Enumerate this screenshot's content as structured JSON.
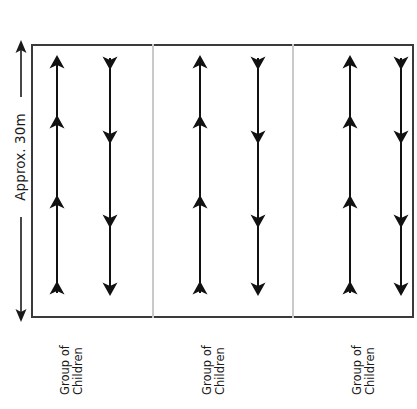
{
  "diagram": {
    "dimension": {
      "label": "Approx. 30m",
      "icon": "double-headed-vertical-arrow",
      "orientation": "vertical",
      "color": "#1a1a1a"
    },
    "frame": {
      "border_color": "#3a3a3a",
      "fill_color": "#ffffff",
      "divider_color": "#c9c9c9"
    },
    "arrow_color": "#111111",
    "groups": [
      {
        "label_line1": "Group of",
        "label_line2": "Children",
        "columns": [
          {
            "direction": "up",
            "icon": "arrow-up-line",
            "marker_count": 4
          },
          {
            "direction": "down",
            "icon": "arrow-down-line",
            "marker_count": 4
          }
        ]
      },
      {
        "label_line1": "Group of",
        "label_line2": "Children",
        "columns": [
          {
            "direction": "up",
            "icon": "arrow-up-line",
            "marker_count": 4
          },
          {
            "direction": "down",
            "icon": "arrow-down-line",
            "marker_count": 4
          }
        ]
      },
      {
        "label_line1": "Group of",
        "label_line2": "Children",
        "columns": [
          {
            "direction": "up",
            "icon": "arrow-up-line",
            "marker_count": 4
          },
          {
            "direction": "down",
            "icon": "arrow-down-line",
            "marker_count": 4
          }
        ]
      }
    ]
  }
}
